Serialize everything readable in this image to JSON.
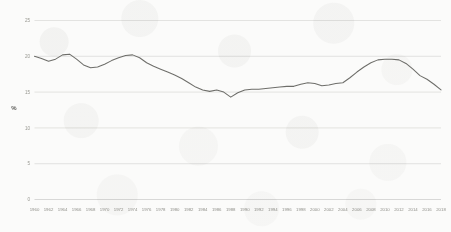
{
  "chart_data": {
    "type": "line",
    "title": "",
    "subtitle": "",
    "xlabel": "",
    "ylabel": "%",
    "ylim": [
      0,
      25
    ],
    "xlim": [
      1960,
      2018
    ],
    "grid": true,
    "legend": false,
    "legend_position": "none",
    "line_color": "#6e6e6a",
    "background_color": "#fbfbfa",
    "gridline_color": "#d8d8d6",
    "y_ticks": [
      0,
      5,
      10,
      15,
      20,
      25
    ],
    "y_tick_labels": [
      "0",
      "5",
      "10",
      "15",
      "20",
      "25"
    ],
    "x_ticks": [
      1960,
      1962,
      1964,
      1966,
      1968,
      1970,
      1972,
      1974,
      1976,
      1978,
      1980,
      1982,
      1984,
      1986,
      1988,
      1990,
      1992,
      1994,
      1996,
      1998,
      2000,
      2002,
      2004,
      2006,
      2008,
      2010,
      2012,
      2014,
      2016,
      2018
    ],
    "x_tick_labels": [
      "1960",
      "1962",
      "1964",
      "1966",
      "1968",
      "1970",
      "1972",
      "1974",
      "1976",
      "1978",
      "1980",
      "1982",
      "1984",
      "1986",
      "1988",
      "1990",
      "1992",
      "1994",
      "1996",
      "1998",
      "2000",
      "2002",
      "2004",
      "2006",
      "2008",
      "2010",
      "2012",
      "2014",
      "2016",
      "2018"
    ],
    "series": [
      {
        "name": "",
        "x": [
          1960,
          1961,
          1962,
          1963,
          1964,
          1965,
          1966,
          1967,
          1968,
          1969,
          1970,
          1971,
          1972,
          1973,
          1974,
          1975,
          1976,
          1977,
          1978,
          1979,
          1980,
          1981,
          1982,
          1983,
          1984,
          1985,
          1986,
          1987,
          1988,
          1989,
          1990,
          1991,
          1992,
          1993,
          1994,
          1995,
          1996,
          1997,
          1998,
          1999,
          2000,
          2001,
          2002,
          2003,
          2004,
          2005,
          2006,
          2007,
          2008,
          2009,
          2010,
          2011,
          2012,
          2013,
          2014,
          2015,
          2016,
          2017,
          2018
        ],
        "values": [
          20.0,
          19.7,
          19.3,
          19.6,
          20.2,
          20.3,
          19.6,
          18.8,
          18.4,
          18.5,
          18.9,
          19.4,
          19.8,
          20.1,
          20.2,
          19.8,
          19.1,
          18.6,
          18.2,
          17.8,
          17.4,
          16.9,
          16.3,
          15.7,
          15.3,
          15.1,
          15.3,
          15.0,
          14.3,
          14.9,
          15.3,
          15.4,
          15.4,
          15.5,
          15.6,
          15.7,
          15.8,
          15.8,
          16.1,
          16.3,
          16.2,
          15.9,
          16.0,
          16.2,
          16.3,
          17.0,
          17.8,
          18.5,
          19.1,
          19.5,
          19.6,
          19.6,
          19.5,
          19.0,
          18.2,
          17.3,
          16.8,
          16.1,
          15.3
        ]
      }
    ]
  }
}
